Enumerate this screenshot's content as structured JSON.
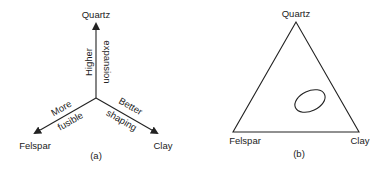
{
  "panel_a": {
    "caption": "(a)",
    "axes": {
      "top": "Quartz",
      "left": "Felspar",
      "right": "Clay"
    },
    "arrow_labels": {
      "vertical_line1": "Higher",
      "vertical_line2": "expansion",
      "left_line1": "More",
      "left_line2": "fusible",
      "right_line1": "Better",
      "right_line2": "shaping"
    }
  },
  "panel_b": {
    "caption": "(b)",
    "vertices": {
      "top": "Quartz",
      "left": "Felspar",
      "right": "Clay"
    }
  },
  "colors": {
    "line": "#222222",
    "background": "#ffffff"
  }
}
